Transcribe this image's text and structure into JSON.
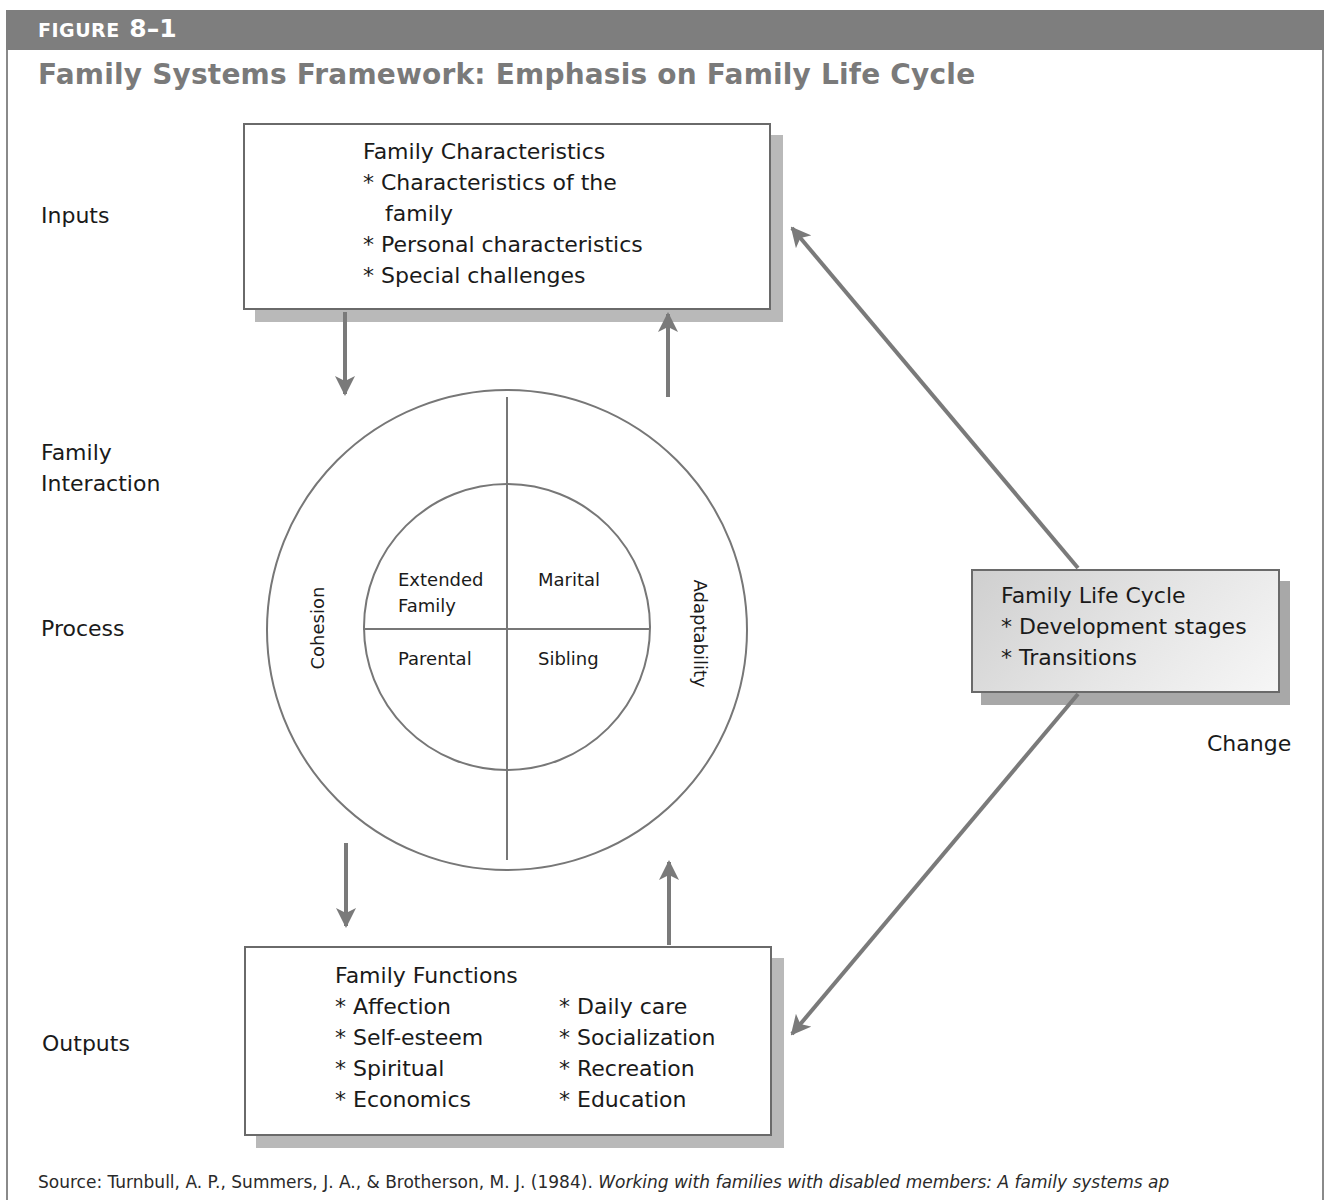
{
  "figure": {
    "label_prefix": "FIGURE",
    "label_number": "8–1",
    "title": "Family Systems Framework: Emphasis on Family Life Cycle"
  },
  "row_labels": {
    "inputs": "Inputs",
    "family_interaction_line1": "Family",
    "family_interaction_line2": "Interaction",
    "process": "Process",
    "outputs": "Outputs",
    "change": "Change"
  },
  "inputs_box": {
    "heading": "Family Characteristics",
    "items": [
      "* Characteristics of the",
      "family",
      "* Personal characteristics",
      "* Special challenges"
    ]
  },
  "process_circle": {
    "outer_left": "Cohesion",
    "outer_right": "Adaptability",
    "quadrants": {
      "top_left_line1": "Extended",
      "top_left_line2": "Family",
      "top_right": "Marital",
      "bottom_left": "Parental",
      "bottom_right": "Sibling"
    }
  },
  "outputs_box": {
    "heading": "Family Functions",
    "left_items": [
      "* Affection",
      "* Self-esteem",
      "* Spiritual",
      "* Economics"
    ],
    "right_items": [
      "* Daily care",
      "* Socialization",
      "* Recreation",
      "* Education"
    ]
  },
  "lifecycle_box": {
    "heading": "Family Life Cycle",
    "items": [
      "* Development stages",
      "* Transitions"
    ]
  },
  "source": {
    "prefix": "Source: Turnbull, A. P., Summers, J. A., & Brotherson, M. J. (1984). ",
    "italic": "Working with families with disabled members: A family systems ap"
  },
  "colors": {
    "header_bar": "#7e7e7e",
    "title": "#7a7a7a",
    "arrow": "#7a7a7a",
    "line": "#6a6a6a",
    "shadow": "#b9b9b9"
  }
}
